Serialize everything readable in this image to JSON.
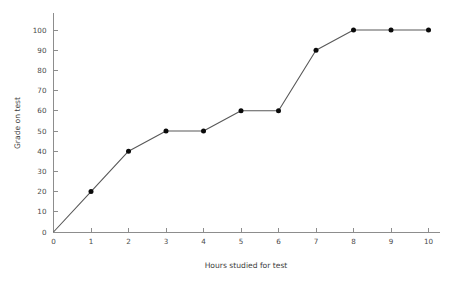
{
  "chart_data": {
    "type": "line",
    "title": "",
    "subtitle": "",
    "xlabel": "Hours studied for test",
    "ylabel": "Grade on test",
    "x": [
      0,
      1,
      2,
      3,
      4,
      5,
      6,
      7,
      8,
      9,
      10
    ],
    "values": [
      0,
      20,
      40,
      50,
      50,
      60,
      60,
      90,
      100,
      100,
      100
    ],
    "series": [
      {
        "name": "Grade on test",
        "x": [
          0,
          1,
          2,
          3,
          4,
          5,
          6,
          7,
          8,
          9,
          10
        ],
        "values": [
          0,
          20,
          40,
          50,
          50,
          60,
          60,
          90,
          100,
          100,
          100
        ]
      }
    ],
    "xticks": [
      0,
      1,
      2,
      3,
      4,
      5,
      6,
      7,
      8,
      9,
      10
    ],
    "xtick_labels": [
      "0",
      "1",
      "2",
      "3",
      "4",
      "5",
      "6",
      "7",
      "8",
      "9",
      "10"
    ],
    "yticks": [
      0,
      10,
      20,
      30,
      40,
      50,
      60,
      70,
      80,
      90,
      100
    ],
    "ytick_labels": [
      "0",
      "10",
      "20",
      "30",
      "40",
      "50",
      "60",
      "70",
      "80",
      "90",
      "100"
    ],
    "xlim": [
      0,
      10
    ],
    "ylim": [
      0,
      100
    ],
    "grid": false,
    "legend": false,
    "legend_position": "none",
    "annotations": [],
    "marker_style": "filled-circle",
    "colors": {
      "background": "#ffffff",
      "line": "#585858",
      "marker": "#0a0a0a",
      "axis": "#8d8d8d",
      "tick_text": "#4a4a4a",
      "axis_title": "#3d3d3d"
    },
    "markers_shown_from_x": 1
  }
}
